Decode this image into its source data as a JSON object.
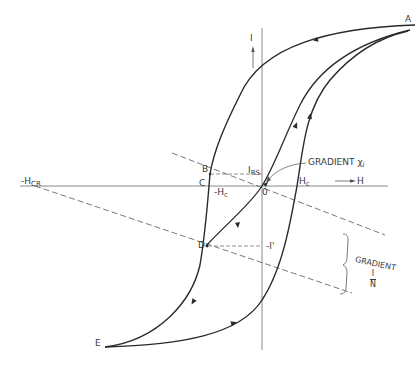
{
  "figure": {
    "type": "hysteresis-loop",
    "axes": {
      "x_label": "H",
      "y_label": "I",
      "origin_label": "0"
    },
    "points": {
      "A": "A",
      "B": "B",
      "C": "C",
      "D": "D",
      "E": "E"
    },
    "labels": {
      "i_rs_main": "I",
      "i_rs_sub": "RS",
      "hc_pos_main": "H",
      "hc_pos_sub": "c",
      "hc_neg_main": "-H",
      "hc_neg_sub": "c",
      "hcr_main": "-H",
      "hcr_sub": "CR",
      "i_prime": "-I'",
      "gradient_chi": "GRADIENT χ",
      "gradient_chi_sub": "i",
      "gradient_n": "GRADIENT",
      "gradient_n_num": "I",
      "gradient_n_den": "N"
    },
    "colors": {
      "curve": "#2a2a2a",
      "axis": "#8a8a8a",
      "dashed": "#555555",
      "text": "#3a3a3a"
    }
  }
}
